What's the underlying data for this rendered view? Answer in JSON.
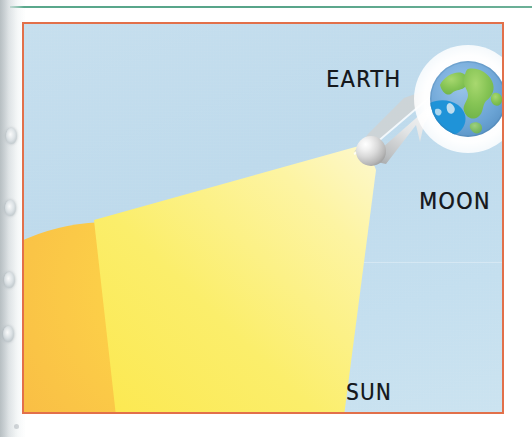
{
  "diagram": {
    "labels": {
      "earth": "EARTH",
      "moon": "MOON",
      "sun": "SUN"
    },
    "bodies": [
      {
        "name": "sun",
        "label": "SUN",
        "shape": "circle",
        "role": "light-source",
        "colors": {
          "highlight": "#ffd84f",
          "mid": "#f9bf45",
          "shadow": "#f2903c"
        }
      },
      {
        "name": "moon",
        "label": "MOON",
        "shape": "circle",
        "role": "occulting-body",
        "colors": {
          "highlight": "#ffffff",
          "mid": "#d9d9d9",
          "shadow": "#7b7b7b"
        }
      },
      {
        "name": "earth",
        "label": "EARTH",
        "shape": "circle",
        "role": "shadow-receiver",
        "colors": {
          "ocean": "#6fa8dc",
          "land": "#7cc04f",
          "umbra": "#1c8fd6",
          "halo": "#ffffff"
        }
      }
    ],
    "rays": {
      "sunlight_cone": {
        "name": "sunlight-cone",
        "from": "sun",
        "to": "moon",
        "color": "#fdf06a"
      },
      "moon_shadow_cone": {
        "name": "moon-shadow-cone",
        "from": "moon",
        "to": "earth",
        "color": "#c9cbcc"
      }
    },
    "frame": {
      "border_color": "#e2704a",
      "sky_color": "#c2dcec"
    },
    "page": {
      "rule_color": "#5aa88c",
      "paper_color": "#ffffff"
    }
  }
}
